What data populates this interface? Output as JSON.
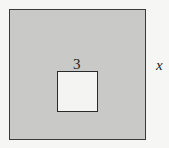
{
  "diagram": {
    "outer_square": {
      "side_label": "x",
      "fill": "#c9c9c7"
    },
    "inner_square": {
      "side_label": "3",
      "fill": "#f4f4f2"
    }
  }
}
